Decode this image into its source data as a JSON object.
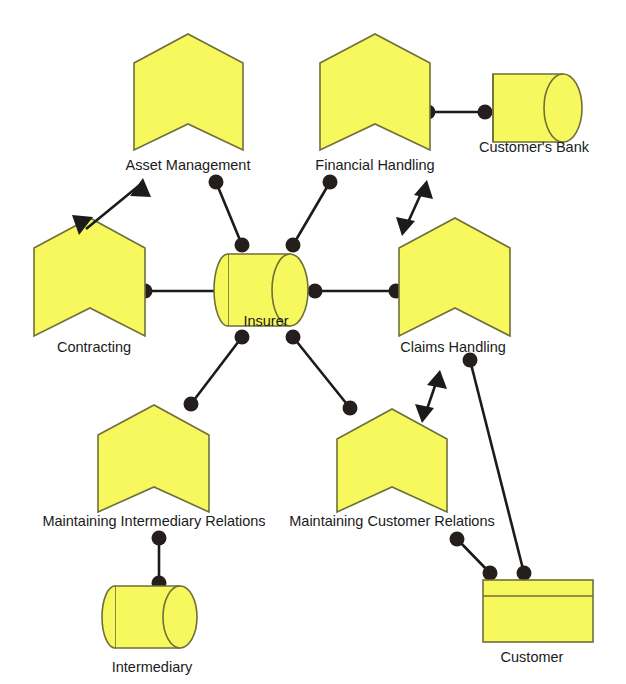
{
  "diagram": {
    "background_color": "#ffffff",
    "shape_fill_color": "#f7f75e",
    "shape_stroke_color": "#6f6f3a",
    "connector_color": "#1b1b1b",
    "label_color": "#1b1b1b"
  },
  "nodes": [
    {
      "id": "asset-management",
      "label": "Asset Management",
      "shape": "chevron",
      "label_x": 188,
      "label_y": 170
    },
    {
      "id": "financial-handling",
      "label": "Financial Handling",
      "shape": "chevron",
      "label_x": 375,
      "label_y": 170
    },
    {
      "id": "customers-bank",
      "label": "Customer's Bank",
      "shape": "cylinder",
      "label_x": 534,
      "label_y": 152
    },
    {
      "id": "contracting",
      "label": "Contracting",
      "shape": "chevron",
      "label_x": 94,
      "label_y": 352
    },
    {
      "id": "insurer",
      "label": "Insurer",
      "shape": "cylinder",
      "label_x": 266,
      "label_y": 326
    },
    {
      "id": "claims-handling",
      "label": "Claims Handling",
      "shape": "chevron",
      "label_x": 453,
      "label_y": 352
    },
    {
      "id": "maintaining-intermediary-relations",
      "label": "Maintaining Intermediary Relations",
      "shape": "chevron",
      "label_x": 154,
      "label_y": 526
    },
    {
      "id": "maintaining-customer-relations",
      "label": "Maintaining Customer Relations",
      "shape": "chevron",
      "label_x": 392,
      "label_y": 526
    },
    {
      "id": "intermediary",
      "label": "Intermediary",
      "shape": "cylinder",
      "label_x": 152,
      "label_y": 664
    },
    {
      "id": "customer",
      "label": "Customer",
      "shape": "node-box",
      "label_x": 532,
      "label_y": 662
    }
  ],
  "connections": [
    {
      "from": "asset-management",
      "to": "insurer",
      "type": "assembly"
    },
    {
      "from": "financial-handling",
      "to": "insurer",
      "type": "assembly"
    },
    {
      "from": "financial-handling",
      "to": "customers-bank",
      "type": "assembly"
    },
    {
      "from": "contracting",
      "to": "insurer",
      "type": "assembly"
    },
    {
      "from": "insurer",
      "to": "claims-handling",
      "type": "assembly"
    },
    {
      "from": "insurer",
      "to": "maintaining-intermediary-relations",
      "type": "assembly"
    },
    {
      "from": "insurer",
      "to": "maintaining-customer-relations",
      "type": "assembly"
    },
    {
      "from": "maintaining-intermediary-relations",
      "to": "intermediary",
      "type": "assembly"
    },
    {
      "from": "maintaining-customer-relations",
      "to": "customer",
      "type": "assembly"
    },
    {
      "from": "claims-handling",
      "to": "customer",
      "type": "assembly"
    },
    {
      "from": "contracting",
      "to": "asset-management",
      "type": "bidirectional-arrow"
    },
    {
      "from": "financial-handling",
      "to": "claims-handling",
      "type": "bidirectional-arrow"
    },
    {
      "from": "claims-handling",
      "to": "maintaining-customer-relations",
      "type": "bidirectional-arrow"
    }
  ]
}
